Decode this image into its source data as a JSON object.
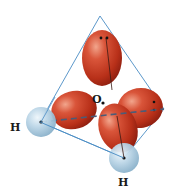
{
  "diagram": {
    "labels": {
      "oxygen": "O",
      "hydrogen_left": "H",
      "hydrogen_bottom": "H"
    },
    "colors": {
      "lobe": "#c83a22",
      "lobe_highlight": "#e8765a",
      "lobe_shadow": "#8e1f10",
      "hydrogen": "#a8c8dc",
      "hydrogen_highlight": "#e4f0f7",
      "tetrahedron": "#4a8cc4",
      "dashed_axis": "#4a5c78",
      "dot": "#111111"
    },
    "elements": {
      "lone_pair_lobes": 2,
      "bonding_lobes": 2,
      "hydrogen_atoms": 2,
      "central_atom": "O"
    }
  }
}
